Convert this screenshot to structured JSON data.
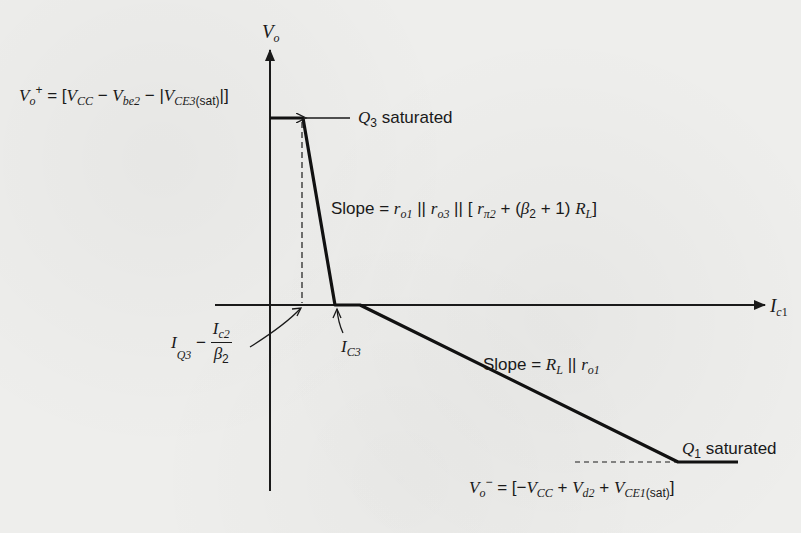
{
  "diagram": {
    "type": "piecewise-linear transfer characteristic",
    "axes": {
      "y_label": "V_o",
      "x_label": "I_c1"
    },
    "labels": {
      "vo_plus": "V_o^+ = [V_CC − V_be2 − |V_CE3(sat)|]",
      "vo_plus_parts": {
        "v": "V",
        "o": "o",
        "plus": "+",
        "eq": " = [",
        "vcc": "V",
        "cc": "CC",
        "minus1": " − ",
        "vbe": "V",
        "be2": "be2",
        "minus2": " − |",
        "vce": "V",
        "ce3": "CE3",
        "sat": "(sat)",
        "close": "|]"
      },
      "q3_saturated": {
        "q": "Q",
        "sub": "3",
        "text": " saturated"
      },
      "slope1": {
        "prefix": "Slope = ",
        "full": "Slope = r_o1 || r_o3 || [ r_π2 + (β2 + 1) R_L]",
        "r": "r",
        "o1": "o1",
        "par1": " || ",
        "o3": "o3",
        "par2": " || [ ",
        "pi2": "π2",
        "plus": " + (",
        "beta": "β",
        "b2": "2",
        "plus1": " + 1) ",
        "R": "R",
        "L": "L",
        "close": "]"
      },
      "iq3_expr": {
        "full": "I_Q3 − I_c2 / β2",
        "I": "I",
        "Q3": "Q3",
        "minus": " − ",
        "num_I": "I",
        "num_sub": "c2",
        "den": "β",
        "den_sub": "2"
      },
      "ic3": {
        "I": "I",
        "sub": "C3"
      },
      "slope2": {
        "prefix": "Slope = ",
        "full": "Slope = R_L || r_o1",
        "R": "R",
        "L": "L",
        "par": " || ",
        "r": "r",
        "o1": "o1"
      },
      "q1_saturated": {
        "q": "Q",
        "sub": "1",
        "text": " saturated"
      },
      "vo_minus": {
        "full": "V_o^− = [−V_CC + V_d2 + V_CE1(sat)]",
        "v": "V",
        "o": "o",
        "minus": "−",
        "eq": " = [−",
        "vcc": "V",
        "cc": "CC",
        "plus1": " + ",
        "vd": "V",
        "d2": "d2",
        "plus2": " + ",
        "vce": "V",
        "ce1": "CE1",
        "sat": "(sat)",
        "close": "]"
      }
    },
    "curve_points": [
      [
        270,
        118
      ],
      [
        303,
        118
      ],
      [
        335,
        305
      ],
      [
        360,
        305
      ],
      [
        678,
        462
      ],
      [
        738,
        462
      ]
    ]
  }
}
